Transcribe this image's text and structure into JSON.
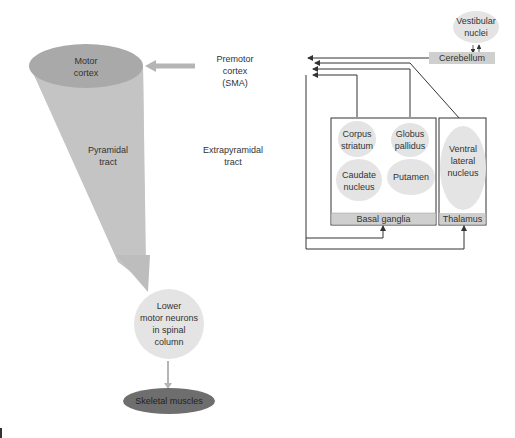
{
  "nodes": {
    "motor_cortex": "Motor\ncortex",
    "pyramidal_tract": "Pyramidal\ntract",
    "premotor_cortex": "Premotor\ncortex\n(SMA)",
    "extrapyramidal_tract": "Extrapyramidal\ntract",
    "vestibular_nuclei": "Vestibular\nnuclei",
    "cerebellum": "Cerebellum",
    "corpus_striatum": "Corpus\nstriatum",
    "globus_pallidus": "Globus\npallidus",
    "caudate_nucleus": "Caudate\nnucleus",
    "putamen": "Putamen",
    "ventral_lateral_nucleus": "Ventral\nlateral\nnucleus",
    "basal_ganglia": "Basal ganglia",
    "thalamus": "Thalamus",
    "lower_motor_neurons": "Lower\nmotor neurons\nin spinal\ncolumn",
    "skeletal_muscles": "Skeletal muscles"
  },
  "colors": {
    "cone": "#c4c4c4",
    "motor_cortex": "#a9a9a9",
    "light_ellipse": "#e4e4e4",
    "label_bar": "#cfcfcf",
    "skeletal": "#6e6e6e",
    "line": "#333333",
    "gray_arrow": "#b5b5b5"
  }
}
